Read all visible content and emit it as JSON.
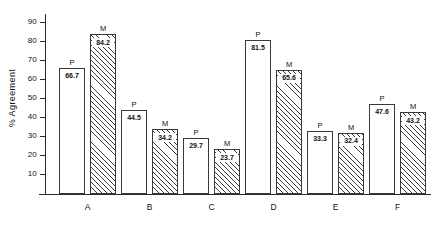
{
  "chart_data": {
    "type": "bar",
    "title": "",
    "xlabel": "",
    "ylabel": "% Agreement",
    "ylim": [
      0,
      95
    ],
    "yticks": [
      10,
      20,
      30,
      40,
      50,
      60,
      70,
      80,
      90
    ],
    "grid": false,
    "legend": "none",
    "categories": [
      "A",
      "B",
      "C",
      "D",
      "E",
      "F"
    ],
    "series": [
      {
        "name": "P",
        "tag": "P",
        "style": "open",
        "values": [
          66.7,
          44.5,
          29.7,
          81.5,
          33.3,
          47.6
        ]
      },
      {
        "name": "M",
        "tag": "M",
        "style": "hatched",
        "values": [
          84.2,
          34.2,
          23.7,
          65.6,
          32.4,
          43.2
        ]
      }
    ],
    "value_labels": {
      "A": {
        "P": "66.7",
        "M": "84.2"
      },
      "B": {
        "P": "44.5",
        "M": "34.2"
      },
      "C": {
        "P": "29.7",
        "M": "23.7"
      },
      "D": {
        "P": "81.5",
        "M": "65.6"
      },
      "E": {
        "P": "33.3",
        "M": "32.4"
      },
      "F": {
        "P": "47.6",
        "M": "43.2"
      }
    },
    "ytick_labels": [
      "10",
      "20",
      "30",
      "40",
      "50",
      "60",
      "70",
      "80",
      "90"
    ]
  },
  "colors": {
    "axis": "#2a2a2a",
    "bar_outline": "#3a3a3a",
    "bar_fill": "#ffffff",
    "hatch": "#3a3a3a",
    "text": "#111111",
    "background": "#ffffff"
  }
}
